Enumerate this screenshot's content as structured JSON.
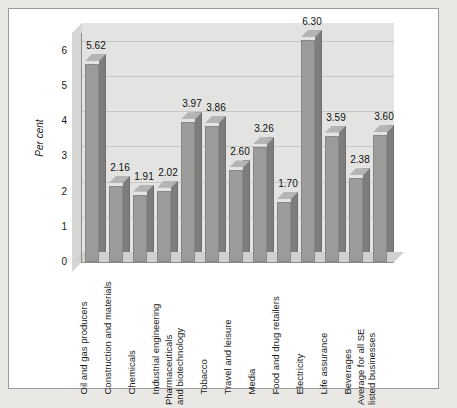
{
  "chart_data": {
    "type": "bar",
    "title": "",
    "subtitle": "",
    "xlabel": "",
    "ylabel": "Per cent",
    "ylim": [
      0,
      6.5
    ],
    "ytick_labels": [
      "0",
      "1",
      "2",
      "3",
      "4",
      "5",
      "6"
    ],
    "ytick_values": [
      0,
      1,
      2,
      3,
      4,
      5,
      6
    ],
    "grid": true,
    "legend": false,
    "legend_position": "none",
    "style": "3d-column",
    "bar_color": "#9b9b99",
    "plot_background": "#e3e3e1",
    "categories": [
      "Oil and gas producers",
      "Construction and materials",
      "Chemicals",
      "Industrial engineering",
      "Pharmaceuticals and biotechnology",
      "Tobacco",
      "Travel and leisure",
      "Media",
      "Food and drug retailers",
      "Electricity",
      "Life assurance",
      "Beverages",
      "Average for all SE listed businesses"
    ],
    "category_lines": [
      [
        "Oil and gas producers"
      ],
      [
        "Construction and materials"
      ],
      [
        "Chemicals"
      ],
      [
        "Industrial engineering"
      ],
      [
        "Pharmaceuticals",
        "and biotechnology"
      ],
      [
        "Tobacco"
      ],
      [
        "Travel and leisure"
      ],
      [
        "Media"
      ],
      [
        "Food and drug retailers"
      ],
      [
        "Electricity"
      ],
      [
        "Life assurance"
      ],
      [
        "Beverages"
      ],
      [
        "Average for all SE",
        "listed businesses"
      ]
    ],
    "values": [
      5.62,
      2.16,
      1.91,
      2.02,
      3.97,
      3.86,
      2.6,
      3.26,
      1.7,
      6.3,
      3.59,
      2.38,
      3.6
    ],
    "data_labels": [
      "5.62",
      "2.16",
      "1.91",
      "2.02",
      "3.97",
      "3.86",
      "2.60",
      "3.26",
      "1.70",
      "6.30",
      "3.59",
      "2.38",
      "3.60"
    ]
  }
}
